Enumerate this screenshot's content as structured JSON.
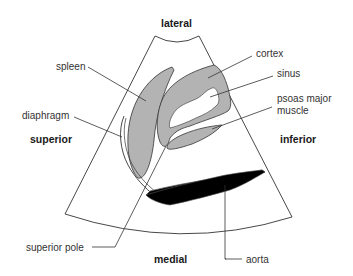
{
  "orientation": {
    "top": "lateral",
    "bottom": "medial",
    "left": "superior",
    "right": "inferior"
  },
  "structures": {
    "spleen": "spleen",
    "diaphragm": "diaphragm",
    "cortex": "cortex",
    "sinus": "sinus",
    "psoas_line1": "psoas major",
    "psoas_line2": "muscle",
    "superior_pole": "superior pole",
    "aorta": "aorta"
  },
  "colors": {
    "organ_fill": "#b3b3b3",
    "outline": "#333333",
    "aorta_fill": "#000000",
    "background": "#ffffff"
  }
}
